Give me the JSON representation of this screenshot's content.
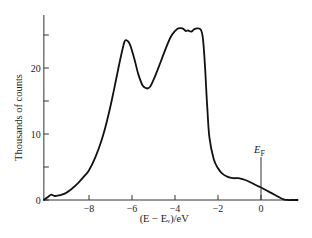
{
  "chart_data": {
    "type": "line",
    "title": "",
    "xlabel": "(E − Eᵥ)/eV",
    "ylabel": "Thousands of counts",
    "xlim": [
      -10.1,
      1.7
    ],
    "ylim": [
      0,
      28
    ],
    "x_ticks": [
      -8,
      -6,
      -4,
      -2,
      0
    ],
    "x_tick_labels": [
      "−8",
      "−6",
      "−4",
      "−2",
      "0"
    ],
    "y_ticks": [
      0,
      5,
      10,
      15,
      20,
      25
    ],
    "y_tick_labels": [
      "0",
      "",
      "10",
      "",
      "20",
      ""
    ],
    "grid": false,
    "annotations": [
      {
        "text": "E",
        "subscript": "F",
        "x": 0,
        "marker": "vertical-line",
        "y_top": 6.5
      }
    ],
    "series": [
      {
        "name": "spectrum",
        "x": [
          -10.1,
          -9.9,
          -9.75,
          -9.6,
          -9.4,
          -9.1,
          -8.8,
          -8.5,
          -8.2,
          -8.0,
          -7.7,
          -7.4,
          -7.1,
          -6.85,
          -6.6,
          -6.45,
          -6.35,
          -6.25,
          -6.1,
          -5.9,
          -5.7,
          -5.5,
          -5.3,
          -5.15,
          -5.0,
          -4.8,
          -4.6,
          -4.4,
          -4.2,
          -4.0,
          -3.85,
          -3.65,
          -3.5,
          -3.4,
          -3.25,
          -3.1,
          -2.95,
          -2.8,
          -2.7,
          -2.6,
          -2.5,
          -2.4,
          -2.2,
          -2.0,
          -1.8,
          -1.55,
          -1.3,
          -1.05,
          -0.8,
          -0.5,
          -0.2,
          0.0,
          0.4,
          0.8,
          1.05,
          1.25,
          1.5,
          1.7
        ],
        "y": [
          0.0,
          0.5,
          0.8,
          0.6,
          0.7,
          1.0,
          1.7,
          2.6,
          3.7,
          4.5,
          6.5,
          9.2,
          12.8,
          16.5,
          20.5,
          22.7,
          24.0,
          24.2,
          23.6,
          21.5,
          19.0,
          17.3,
          16.9,
          17.2,
          18.2,
          19.8,
          21.5,
          23.2,
          24.7,
          25.6,
          26.0,
          26.0,
          25.6,
          25.7,
          25.5,
          25.9,
          26.0,
          25.8,
          24.5,
          20.0,
          14.0,
          9.5,
          6.2,
          4.8,
          4.0,
          3.5,
          3.3,
          3.3,
          3.1,
          2.7,
          2.2,
          1.9,
          1.2,
          0.5,
          0.1,
          0.0,
          0.0,
          0.0
        ]
      }
    ]
  }
}
